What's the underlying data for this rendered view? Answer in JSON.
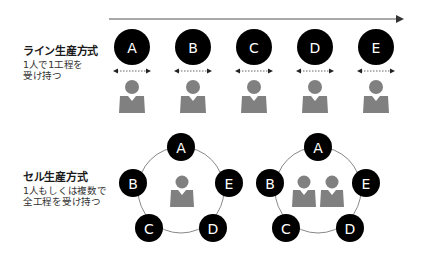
{
  "line_section": {
    "title": "ライン生産方式",
    "desc_lines": [
      "1人で1工程を",
      "受け持つ"
    ],
    "stations": [
      {
        "label": "A",
        "x": 132
      },
      {
        "label": "B",
        "x": 193
      },
      {
        "label": "C",
        "x": 254
      },
      {
        "label": "D",
        "x": 315
      },
      {
        "label": "E",
        "x": 376
      }
    ]
  },
  "cell_section": {
    "title": "セル生産方式",
    "desc_lines": [
      "1人もしくは複数で",
      "全工程を受け持つ"
    ],
    "cells": [
      {
        "workers": 1,
        "nodes": [
          {
            "label": "A"
          },
          {
            "label": "B"
          },
          {
            "label": "C"
          },
          {
            "label": "D"
          },
          {
            "label": "E"
          }
        ]
      },
      {
        "workers": 2,
        "nodes": [
          {
            "label": "A"
          },
          {
            "label": "B"
          },
          {
            "label": "C"
          },
          {
            "label": "D"
          },
          {
            "label": "E"
          }
        ]
      }
    ]
  },
  "colors": {
    "node_fill": "#000000",
    "node_text": "#ffffff",
    "worker": "#808080",
    "line": "#555555",
    "ring": "#888888"
  }
}
